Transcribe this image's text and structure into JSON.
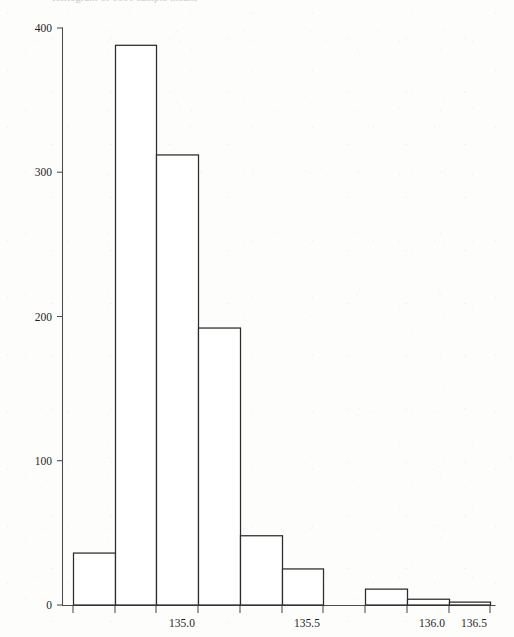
{
  "chart_data": {
    "type": "bar",
    "title": "Histogram of 1000 sample means",
    "xlabel": "",
    "ylabel": "",
    "bin_width": 0.1,
    "bin_edges": [
      134.6,
      134.7,
      134.8,
      134.9,
      135.0,
      135.1,
      135.2,
      135.3,
      135.4,
      135.5,
      135.6
    ],
    "categories": [
      "134.6-134.7",
      "134.7-134.8",
      "134.8-134.9",
      "134.9-135.0",
      "135.0-135.1",
      "135.1-135.2",
      "135.2-135.3",
      "135.3-135.4",
      "135.4-135.5",
      "135.5-135.6"
    ],
    "values": [
      36,
      388,
      312,
      192,
      48,
      25,
      0,
      11,
      4,
      2
    ],
    "bar_pixel_edges": [
      [
        73,
        115
      ],
      [
        115,
        156
      ],
      [
        156,
        198
      ],
      [
        198,
        240
      ],
      [
        240,
        282
      ],
      [
        282,
        323
      ],
      [
        323,
        365
      ],
      [
        365,
        407
      ],
      [
        407,
        449
      ],
      [
        449,
        490
      ]
    ],
    "xlim": [
      134.58,
      135.62
    ],
    "ylim": [
      0,
      400
    ],
    "y_ticks": [
      0,
      100,
      200,
      300,
      400
    ],
    "y_tick_labels": [
      "0",
      "100",
      "200",
      "300",
      "400"
    ],
    "x_ticks": [
      135.0,
      135.5,
      136.0,
      136.5
    ],
    "x_tick_labels": [
      "135.0",
      "135.5",
      "136.0",
      "136.5"
    ],
    "x_tick_pixels": [
      156,
      281,
      406,
      448
    ],
    "x_minor_tick_pixels": [
      73,
      115,
      156,
      198,
      240,
      282,
      323,
      365,
      407,
      449,
      490
    ],
    "grid": false,
    "legend": null,
    "bar_fill": "#ffffff",
    "bar_stroke": "#2b2b2b",
    "axis_color": "#4a4a4a",
    "background": "#fdfdfc"
  },
  "axes": {
    "y_axis_name": "frequency-axis",
    "x_axis_name": "value-axis"
  }
}
